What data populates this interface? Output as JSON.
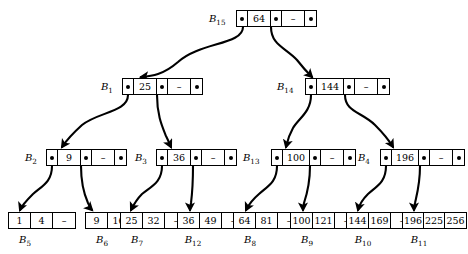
{
  "diagram": {
    "dash_symbol": "–",
    "pointer_symbol": "•"
  },
  "internal_nodes": [
    {
      "id": "B15",
      "label": "B",
      "subscript": "15",
      "key": "64",
      "empty": "–",
      "label_x": 209,
      "label_y": 13,
      "node_x": 236,
      "node_y": 10
    },
    {
      "id": "B1",
      "label": "B",
      "subscript": "1",
      "key": "25",
      "empty": "–",
      "label_x": 101,
      "label_y": 81,
      "node_x": 122,
      "node_y": 78
    },
    {
      "id": "B14",
      "label": "B",
      "subscript": "14",
      "key": "144",
      "empty": "–",
      "label_x": 277,
      "label_y": 81,
      "node_x": 305,
      "node_y": 78
    },
    {
      "id": "B2",
      "label": "B",
      "subscript": "2",
      "key": "9",
      "empty": "–",
      "label_x": 25,
      "label_y": 152,
      "node_x": 46,
      "node_y": 149
    },
    {
      "id": "B3",
      "label": "B",
      "subscript": "3",
      "key": "36",
      "empty": "–",
      "label_x": 135,
      "label_y": 152,
      "node_x": 156,
      "node_y": 149
    },
    {
      "id": "B13",
      "label": "B",
      "subscript": "13",
      "key": "100",
      "empty": "–",
      "label_x": 243,
      "label_y": 152,
      "node_x": 271,
      "node_y": 149
    },
    {
      "id": "B4",
      "label": "B",
      "subscript": "4",
      "key": "196",
      "empty": "–",
      "label_x": 358,
      "label_y": 152,
      "node_x": 380,
      "node_y": 149
    }
  ],
  "leaf_nodes": [
    {
      "id": "B5",
      "label": "B",
      "subscript": "5",
      "values": [
        "1",
        "4",
        "–"
      ],
      "node_x": 8,
      "node_y": 212,
      "label_x": 25,
      "label_y": 234
    },
    {
      "id": "B6",
      "label": "B",
      "subscript": "6",
      "values": [
        "9",
        "16",
        "–"
      ],
      "node_x": 85,
      "node_y": 212,
      "label_x": 102,
      "label_y": 234
    },
    {
      "id": "B7",
      "label": "B",
      "subscript": "7",
      "values": [
        "25",
        "32",
        "–"
      ],
      "node_x": 120,
      "node_y": 212,
      "label_x": 137,
      "label_y": 234
    },
    {
      "id": "B12",
      "label": "B",
      "subscript": "12",
      "values": [
        "36",
        "49",
        "–"
      ],
      "node_x": 177,
      "node_y": 212,
      "label_x": 193,
      "label_y": 234
    },
    {
      "id": "B8",
      "label": "B",
      "subscript": "8",
      "values": [
        "64",
        "81",
        "–"
      ],
      "node_x": 233,
      "node_y": 212,
      "label_x": 250,
      "label_y": 234
    },
    {
      "id": "B9",
      "label": "B",
      "subscript": "9",
      "values": [
        "100",
        "121",
        "–"
      ],
      "node_x": 290,
      "node_y": 212,
      "label_x": 307,
      "label_y": 234
    },
    {
      "id": "B10",
      "label": "B",
      "subscript": "10",
      "values": [
        "144",
        "169",
        "–"
      ],
      "node_x": 346,
      "node_y": 212,
      "label_x": 363,
      "label_y": 234
    },
    {
      "id": "B11",
      "label": "B",
      "subscript": "11",
      "values": [
        "196",
        "225",
        "256"
      ],
      "node_x": 402,
      "node_y": 212,
      "label_x": 419,
      "label_y": 234
    }
  ],
  "edges": [
    {
      "from": "B15",
      "to": "B1",
      "path": "M 243,27 C 243,45 200,42 178,62 C 163,75 152,76 141,77"
    },
    {
      "from": "B15",
      "to": "B14",
      "path": "M 271,27 C 271,45 286,48 297,60 C 304,69 308,73 312,77"
    },
    {
      "from": "B1",
      "to": "B2",
      "path": "M 128,95 C 128,112 98,112 82,125 C 71,135 66,141 62,147"
    },
    {
      "from": "B1",
      "to": "B3",
      "path": "M 157,95 C 157,115 162,126 166,136 C 169,142 170,145 171,147"
    },
    {
      "from": "B14",
      "to": "B13",
      "path": "M 311,95 C 311,112 299,118 293,128 C 288,137 287,143 286,147"
    },
    {
      "from": "B14",
      "to": "B4",
      "path": "M 345,95 C 345,112 362,112 375,125 C 384,134 390,142 393,147"
    },
    {
      "from": "B2",
      "to": "B5",
      "path": "M 52,166 C 52,182 42,186 33,194 C 26,201 22,205 20,210"
    },
    {
      "from": "B2",
      "to": "B6",
      "path": "M 81,166 C 81,184 84,194 88,203 C 90,207 91,209 92,210"
    },
    {
      "from": "B3",
      "to": "B7",
      "path": "M 162,166 C 162,182 152,186 142,194 C 136,200 133,206 131,210"
    },
    {
      "from": "B3",
      "to": "B12",
      "path": "M 193,166 C 193,184 192,195 191,203 C 190,207 190,209 190,210"
    },
    {
      "from": "B13",
      "to": "B8",
      "path": "M 277,166 C 277,182 268,186 259,194 C 252,200 248,206 246,210"
    },
    {
      "from": "B13",
      "to": "B9",
      "path": "M 310,166 C 310,184 307,194 304,203 C 303,207 303,209 303,210"
    },
    {
      "from": "B4",
      "to": "B10",
      "path": "M 386,166 C 386,182 377,186 368,194 C 362,200 359,206 358,210"
    },
    {
      "from": "B4",
      "to": "B11",
      "path": "M 420,166 C 420,184 417,194 415,203 C 414,207 414,209 414,210"
    }
  ]
}
